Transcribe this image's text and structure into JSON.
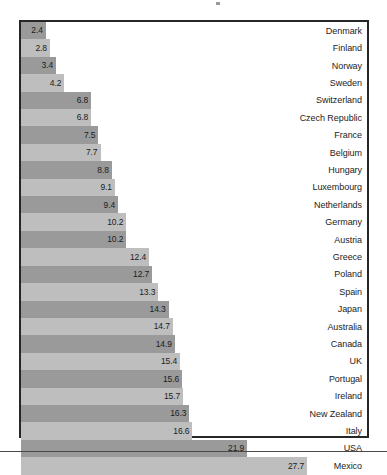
{
  "chart_data": {
    "type": "bar",
    "orientation": "horizontal",
    "title": "",
    "subtitle": "",
    "xlabel": "",
    "ylabel": "",
    "grid": false,
    "legend": null,
    "xlim": [
      0,
      33.5
    ],
    "value_label_format": "one-decimal",
    "sorted": "ascending",
    "categories": [
      "Denmark",
      "Finland",
      "Norway",
      "Sweden",
      "Switzerland",
      "Czech Republic",
      "France",
      "Belgium",
      "Hungary",
      "Luxembourg",
      "Netherlands",
      "Germany",
      "Austria",
      "Greece",
      "Poland",
      "Spain",
      "Japan",
      "Australia",
      "Canada",
      "UK",
      "Portugal",
      "Ireland",
      "New Zealand",
      "Italy",
      "USA",
      "Mexico"
    ],
    "values": [
      2.4,
      2.8,
      3.4,
      4.2,
      6.8,
      6.8,
      7.5,
      7.7,
      8.8,
      9.1,
      10.2,
      10.2,
      null,
      12.4,
      12.7,
      13.3,
      14.3,
      14.7,
      14.9,
      15.4,
      15.6,
      15.7,
      16.3,
      16.6,
      21.9,
      27.7
    ],
    "rows": [
      {
        "label": "Denmark",
        "value": 2.4,
        "text": "2.4",
        "shade": "dark"
      },
      {
        "label": "Finland",
        "value": 2.8,
        "text": "2.8",
        "shade": "light"
      },
      {
        "label": "Norway",
        "value": 3.4,
        "text": "3.4",
        "shade": "dark"
      },
      {
        "label": "Sweden",
        "value": 4.2,
        "text": "4.2",
        "shade": "light"
      },
      {
        "label": "Switzerland",
        "value": 6.8,
        "text": "6.8",
        "shade": "dark"
      },
      {
        "label": "Czech Republic",
        "value": 6.8,
        "text": "6.8",
        "shade": "light"
      },
      {
        "label": "France",
        "value": 7.5,
        "text": "7.5",
        "shade": "dark"
      },
      {
        "label": "Belgium",
        "value": 7.7,
        "text": "7.7",
        "shade": "light"
      },
      {
        "label": "Hungary",
        "value": 8.8,
        "text": "8.8",
        "shade": "dark"
      },
      {
        "label": "Luxembourg",
        "value": 9.1,
        "text": "9.1",
        "shade": "light"
      },
      {
        "label": "Netherlands",
        "value": 9.4,
        "text": "9.4",
        "shade": "dark"
      },
      {
        "label": "Germany",
        "value": 10.2,
        "text": "10.2",
        "shade": "light"
      },
      {
        "label": "Austria",
        "value": 10.2,
        "text": "10.2",
        "shade": "dark"
      },
      {
        "label": "Greece",
        "value": 12.4,
        "text": "12.4",
        "shade": "light"
      },
      {
        "label": "Poland",
        "value": 12.7,
        "text": "12.7",
        "shade": "dark"
      },
      {
        "label": "Spain",
        "value": 13.3,
        "text": "13.3",
        "shade": "light"
      },
      {
        "label": "Japan",
        "value": 14.3,
        "text": "14.3",
        "shade": "dark"
      },
      {
        "label": "Australia",
        "value": 14.7,
        "text": "14.7",
        "shade": "light"
      },
      {
        "label": "Canada",
        "value": 14.9,
        "text": "14.9",
        "shade": "dark"
      },
      {
        "label": "UK",
        "value": 15.4,
        "text": "15.4",
        "shade": "light"
      },
      {
        "label": "Portugal",
        "value": 15.6,
        "text": "15.6",
        "shade": "dark"
      },
      {
        "label": "Ireland",
        "value": 15.7,
        "text": "15.7",
        "shade": "light"
      },
      {
        "label": "New Zealand",
        "value": 16.3,
        "text": "16.3",
        "shade": "dark"
      },
      {
        "label": "Italy",
        "value": 16.6,
        "text": "16.6",
        "shade": "light"
      },
      {
        "label": "USA",
        "value": 21.9,
        "text": "21.9",
        "shade": "dark"
      },
      {
        "label": "Mexico",
        "value": 27.7,
        "text": "27.7",
        "shade": "light"
      }
    ]
  },
  "colors": {
    "bar_dark": "#9a9a9a",
    "bar_light": "#bebebe",
    "frame": "#262626",
    "text": "#1c1c1c",
    "background": "#ffffff"
  }
}
